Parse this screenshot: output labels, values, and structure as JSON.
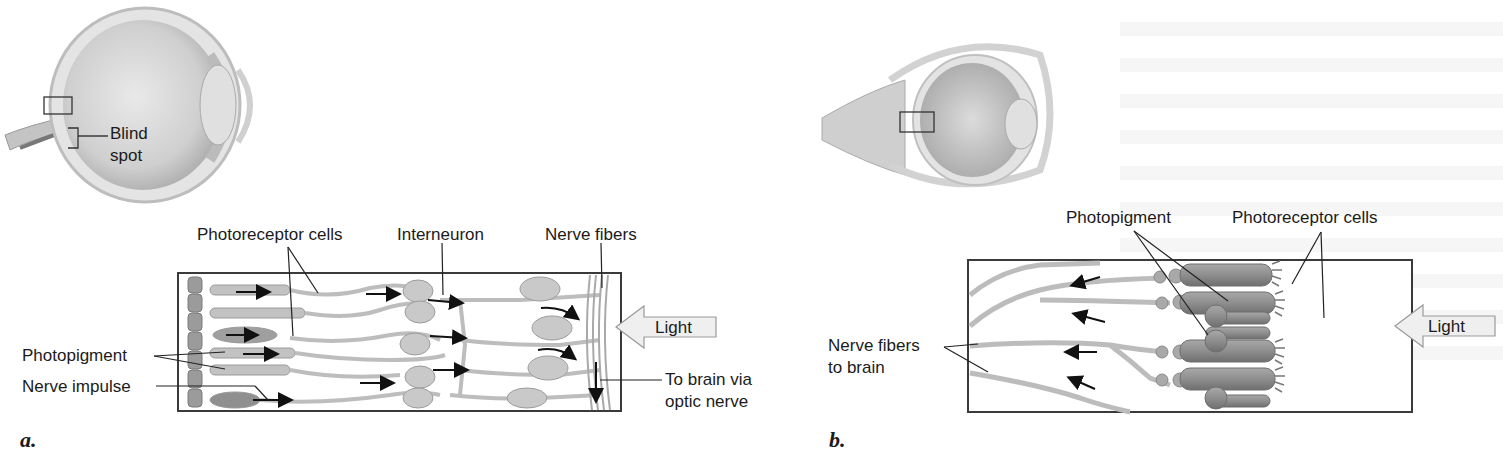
{
  "panel_a": {
    "letter": "a.",
    "eye_labels": {
      "blind_spot_line1": "Blind",
      "blind_spot_line2": "spot"
    },
    "labels": {
      "photoreceptor_cells": "Photoreceptor cells",
      "interneuron": "Interneuron",
      "nerve_fibers": "Nerve fibers",
      "photopigment": "Photopigment",
      "nerve_impulse": "Nerve impulse",
      "light": "Light",
      "to_brain_line1": "To brain via",
      "to_brain_line2": "optic nerve"
    }
  },
  "panel_b": {
    "letter": "b.",
    "labels": {
      "photopigment": "Photopigment",
      "photoreceptor_cells": "Photoreceptor cells",
      "nerve_fibers_line1": "Nerve fibers",
      "nerve_fibers_line2": "to brain",
      "light": "Light"
    }
  },
  "colors": {
    "cell_fill": "#b8b8b8",
    "cell_dark": "#8a8a8a",
    "frame": "#3a3a3a",
    "light_arrow_fill": "#eeeeee"
  }
}
